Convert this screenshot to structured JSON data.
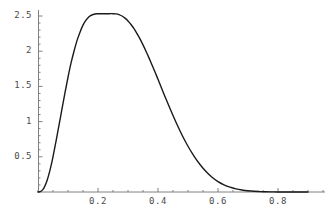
{
  "figure": {
    "background_color": "#ffffff",
    "width": 331,
    "height": 217
  },
  "axes": {
    "color": "#808080",
    "x_axis_name": "x-axis",
    "y_axis_name": "y-axis"
  },
  "chart_data": {
    "type": "line",
    "title": "",
    "subtitle": "",
    "xlabel": "",
    "ylabel": "",
    "xlim": [
      -0.02,
      0.98
    ],
    "ylim": [
      0,
      2.72
    ],
    "grid": false,
    "legend": null,
    "legend_position": "none",
    "line_color": "#1a1a1a",
    "line_width": 1.4,
    "axis_color": "#808080",
    "x_ticks": [
      0.2,
      0.4,
      0.6,
      0.8
    ],
    "x_tick_labels": [
      "0.2",
      "0.4",
      "0.6",
      "0.8"
    ],
    "x_minor_tick_step": 0.05,
    "y_ticks": [
      0.5,
      1,
      1.5,
      2,
      2.5
    ],
    "y_tick_labels": [
      "0.5",
      "1",
      "1.5",
      "2",
      "2.5"
    ],
    "y_minor_tick_step": 0.1,
    "peak": {
      "x": 0.26,
      "y": 2.53
    },
    "series": [
      {
        "name": "density",
        "x": [
          0.0,
          0.01,
          0.02,
          0.03,
          0.04,
          0.05,
          0.06,
          0.07,
          0.08,
          0.09,
          0.1,
          0.11,
          0.12,
          0.13,
          0.14,
          0.15,
          0.16,
          0.17,
          0.18,
          0.19,
          0.2,
          0.21,
          0.22,
          0.23,
          0.24,
          0.25,
          0.26,
          0.27,
          0.28,
          0.29,
          0.3,
          0.31,
          0.32,
          0.33,
          0.34,
          0.35,
          0.36,
          0.37,
          0.38,
          0.39,
          0.4,
          0.42,
          0.44,
          0.46,
          0.48,
          0.5,
          0.52,
          0.54,
          0.56,
          0.58,
          0.6,
          0.62,
          0.64,
          0.66,
          0.68,
          0.7,
          0.72,
          0.74,
          0.76,
          0.78,
          0.8,
          0.85,
          0.9
        ],
        "y": [
          0.0,
          0.01,
          0.06,
          0.16,
          0.31,
          0.5,
          0.72,
          0.95,
          1.18,
          1.41,
          1.63,
          1.83,
          2.0,
          2.15,
          2.27,
          2.37,
          2.44,
          2.49,
          2.515,
          2.528,
          2.532,
          2.533,
          2.532,
          2.532,
          2.533,
          2.533,
          2.53,
          2.52,
          2.5,
          2.47,
          2.43,
          2.38,
          2.32,
          2.25,
          2.175,
          2.09,
          2.0,
          1.905,
          1.805,
          1.705,
          1.6,
          1.39,
          1.185,
          0.99,
          0.81,
          0.65,
          0.51,
          0.39,
          0.29,
          0.21,
          0.148,
          0.102,
          0.068,
          0.044,
          0.028,
          0.017,
          0.01,
          0.006,
          0.003,
          0.002,
          0.001,
          0.0,
          0.0
        ]
      }
    ]
  }
}
